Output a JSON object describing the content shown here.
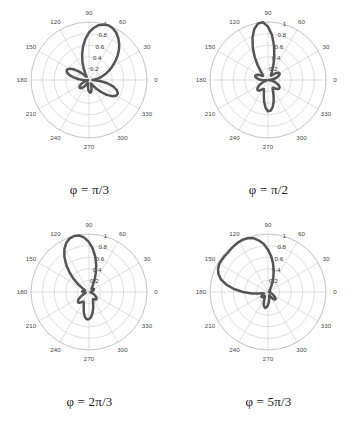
{
  "figure": {
    "background_color": "#ffffff",
    "curve_color": "#555555",
    "grid_color": "#b9b9b9",
    "panel_count": 4
  },
  "chart_data": [
    {
      "type": "line",
      "subtype": "polar",
      "title": "",
      "caption": "φ = π/3",
      "caption_parts": {
        "variable": "φ",
        "equals": "=",
        "value": "π/3"
      },
      "panel_index": 0,
      "xlabel": "",
      "ylabel": "",
      "rlim": [
        0,
        1
      ],
      "rticks": [
        0.2,
        0.4,
        0.6,
        0.8,
        1
      ],
      "rtick_labels": [
        "0.2",
        "0.4",
        "0.6",
        "0.8",
        "1"
      ],
      "theta_ticks_deg": [
        0,
        30,
        60,
        90,
        120,
        150,
        180,
        210,
        240,
        270,
        300,
        330
      ],
      "theta_tick_labels": [
        "0",
        "30",
        "60",
        "90",
        "120",
        "150",
        "180",
        "210",
        "240",
        "270",
        "300",
        "330"
      ],
      "theta_direction": "counterclockwise",
      "theta_zero_location": "E",
      "grid": true,
      "legend": "none",
      "theta_deg": [
        0,
        5,
        10,
        15,
        20,
        25,
        30,
        35,
        40,
        45,
        50,
        55,
        60,
        65,
        70,
        75,
        80,
        85,
        90,
        95,
        100,
        105,
        110,
        115,
        120,
        125,
        130,
        135,
        140,
        145,
        150,
        155,
        160,
        165,
        170,
        175,
        180,
        185,
        190,
        195,
        200,
        205,
        210,
        215,
        220,
        225,
        230,
        235,
        240,
        245,
        250,
        255,
        260,
        265,
        270,
        275,
        280,
        285,
        290,
        295,
        300,
        305,
        310,
        315,
        320,
        325,
        330,
        335,
        340,
        345,
        350,
        355,
        360
      ],
      "r": [
        0.06,
        0.1,
        0.16,
        0.23,
        0.3,
        0.38,
        0.46,
        0.55,
        0.64,
        0.73,
        0.81,
        0.88,
        0.94,
        0.98,
        1.0,
        0.99,
        0.96,
        0.9,
        0.82,
        0.71,
        0.59,
        0.46,
        0.33,
        0.21,
        0.12,
        0.07,
        0.08,
        0.14,
        0.23,
        0.32,
        0.39,
        0.42,
        0.41,
        0.36,
        0.28,
        0.19,
        0.1,
        0.04,
        0.02,
        0.04,
        0.08,
        0.13,
        0.17,
        0.2,
        0.21,
        0.2,
        0.17,
        0.13,
        0.09,
        0.06,
        0.05,
        0.07,
        0.11,
        0.16,
        0.2,
        0.22,
        0.21,
        0.17,
        0.12,
        0.08,
        0.07,
        0.11,
        0.19,
        0.29,
        0.4,
        0.49,
        0.54,
        0.55,
        0.51,
        0.43,
        0.32,
        0.19,
        0.06
      ]
    },
    {
      "type": "line",
      "subtype": "polar",
      "title": "",
      "caption": "φ = π/2",
      "caption_parts": {
        "variable": "φ",
        "equals": "=",
        "value": "π/2"
      },
      "panel_index": 1,
      "xlabel": "",
      "ylabel": "",
      "rlim": [
        0,
        1
      ],
      "rticks": [
        0.2,
        0.4,
        0.6,
        0.8,
        1
      ],
      "rtick_labels": [
        "0.2",
        "0.4",
        "0.6",
        "0.8",
        "1"
      ],
      "theta_ticks_deg": [
        0,
        30,
        60,
        90,
        120,
        150,
        180,
        210,
        240,
        270,
        300,
        330
      ],
      "theta_tick_labels": [
        "0",
        "30",
        "60",
        "90",
        "120",
        "150",
        "180",
        "210",
        "240",
        "270",
        "300",
        "330"
      ],
      "theta_direction": "counterclockwise",
      "theta_zero_location": "E",
      "grid": true,
      "legend": "none",
      "theta_deg": [
        0,
        5,
        10,
        15,
        20,
        25,
        30,
        35,
        40,
        45,
        50,
        55,
        60,
        65,
        70,
        75,
        80,
        85,
        90,
        95,
        100,
        105,
        110,
        115,
        120,
        125,
        130,
        135,
        140,
        145,
        150,
        155,
        160,
        165,
        170,
        175,
        180,
        185,
        190,
        195,
        200,
        205,
        210,
        215,
        220,
        225,
        230,
        235,
        240,
        245,
        250,
        255,
        260,
        265,
        270,
        275,
        280,
        285,
        290,
        295,
        300,
        305,
        310,
        315,
        320,
        325,
        330,
        335,
        340,
        345,
        350,
        355,
        360
      ],
      "r": [
        0.01,
        0.05,
        0.1,
        0.15,
        0.19,
        0.22,
        0.23,
        0.22,
        0.19,
        0.15,
        0.11,
        0.09,
        0.1,
        0.16,
        0.27,
        0.42,
        0.6,
        0.78,
        0.92,
        1.0,
        0.99,
        0.91,
        0.78,
        0.62,
        0.46,
        0.31,
        0.2,
        0.13,
        0.11,
        0.13,
        0.17,
        0.21,
        0.23,
        0.23,
        0.2,
        0.16,
        0.11,
        0.06,
        0.02,
        0.02,
        0.06,
        0.11,
        0.17,
        0.21,
        0.24,
        0.25,
        0.24,
        0.21,
        0.18,
        0.17,
        0.2,
        0.28,
        0.38,
        0.48,
        0.54,
        0.53,
        0.47,
        0.38,
        0.28,
        0.2,
        0.16,
        0.16,
        0.19,
        0.22,
        0.24,
        0.24,
        0.23,
        0.2,
        0.16,
        0.12,
        0.08,
        0.04,
        0.01
      ]
    },
    {
      "type": "line",
      "subtype": "polar",
      "title": "",
      "caption": "φ = 2π/3",
      "caption_parts": {
        "variable": "φ",
        "equals": "=",
        "value": "2π/3"
      },
      "panel_index": 2,
      "xlabel": "",
      "ylabel": "",
      "rlim": [
        0,
        1
      ],
      "rticks": [
        0.2,
        0.4,
        0.6,
        0.8,
        1
      ],
      "rtick_labels": [
        "0.2",
        "0.4",
        "0.6",
        "0.8",
        "1"
      ],
      "theta_ticks_deg": [
        0,
        30,
        60,
        90,
        120,
        150,
        180,
        210,
        240,
        270,
        300,
        330
      ],
      "theta_tick_labels": [
        "0",
        "30",
        "60",
        "90",
        "120",
        "150",
        "180",
        "210",
        "240",
        "270",
        "300",
        "330"
      ],
      "theta_direction": "counterclockwise",
      "theta_zero_location": "E",
      "grid": true,
      "legend": "none",
      "theta_deg": [
        0,
        5,
        10,
        15,
        20,
        25,
        30,
        35,
        40,
        45,
        50,
        55,
        60,
        65,
        70,
        75,
        80,
        85,
        90,
        95,
        100,
        105,
        110,
        115,
        120,
        125,
        130,
        135,
        140,
        145,
        150,
        155,
        160,
        165,
        170,
        175,
        180,
        185,
        190,
        195,
        200,
        205,
        210,
        215,
        220,
        225,
        230,
        235,
        240,
        245,
        250,
        255,
        260,
        265,
        270,
        275,
        280,
        285,
        290,
        295,
        300,
        305,
        310,
        315,
        320,
        325,
        330,
        335,
        340,
        345,
        350,
        355,
        360
      ],
      "r": [
        0.03,
        0.03,
        0.04,
        0.06,
        0.08,
        0.09,
        0.1,
        0.1,
        0.09,
        0.08,
        0.07,
        0.08,
        0.13,
        0.22,
        0.34,
        0.48,
        0.62,
        0.75,
        0.86,
        0.94,
        0.99,
        1.0,
        0.98,
        0.93,
        0.85,
        0.74,
        0.61,
        0.47,
        0.34,
        0.22,
        0.13,
        0.08,
        0.07,
        0.09,
        0.11,
        0.12,
        0.11,
        0.09,
        0.07,
        0.06,
        0.08,
        0.12,
        0.17,
        0.22,
        0.25,
        0.26,
        0.24,
        0.21,
        0.19,
        0.21,
        0.27,
        0.35,
        0.43,
        0.47,
        0.47,
        0.43,
        0.36,
        0.28,
        0.21,
        0.16,
        0.14,
        0.15,
        0.17,
        0.18,
        0.17,
        0.15,
        0.12,
        0.09,
        0.06,
        0.04,
        0.03,
        0.03,
        0.03
      ]
    },
    {
      "type": "line",
      "subtype": "polar",
      "title": "",
      "caption": "φ = 5π/3",
      "caption_parts": {
        "variable": "φ",
        "equals": "=",
        "value": "5π/3"
      },
      "panel_index": 3,
      "xlabel": "",
      "ylabel": "",
      "rlim": [
        0,
        1
      ],
      "rticks": [
        0.2,
        0.4,
        0.6,
        0.8,
        1
      ],
      "rtick_labels": [
        "0.2",
        "0.4",
        "0.6",
        "0.8",
        "1"
      ],
      "theta_ticks_deg": [
        0,
        30,
        60,
        90,
        120,
        150,
        180,
        210,
        240,
        270,
        300,
        330
      ],
      "theta_tick_labels": [
        "0",
        "30",
        "60",
        "90",
        "120",
        "150",
        "180",
        "210",
        "240",
        "270",
        "300",
        "330"
      ],
      "theta_direction": "counterclockwise",
      "theta_zero_location": "E",
      "grid": true,
      "legend": "none",
      "theta_deg": [
        0,
        5,
        10,
        15,
        20,
        25,
        30,
        35,
        40,
        45,
        50,
        55,
        60,
        65,
        70,
        75,
        80,
        85,
        90,
        95,
        100,
        105,
        110,
        115,
        120,
        125,
        130,
        135,
        140,
        145,
        150,
        155,
        160,
        165,
        170,
        175,
        180,
        185,
        190,
        195,
        200,
        205,
        210,
        215,
        220,
        225,
        230,
        235,
        240,
        245,
        250,
        255,
        260,
        265,
        270,
        275,
        280,
        285,
        290,
        295,
        300,
        305,
        310,
        315,
        320,
        325,
        330,
        335,
        340,
        345,
        350,
        355,
        360
      ],
      "r": [
        0.02,
        0.02,
        0.02,
        0.03,
        0.03,
        0.04,
        0.04,
        0.04,
        0.04,
        0.04,
        0.05,
        0.07,
        0.11,
        0.18,
        0.27,
        0.38,
        0.5,
        0.62,
        0.73,
        0.83,
        0.9,
        0.96,
        0.99,
        1.0,
        1.0,
        0.99,
        0.98,
        0.97,
        0.97,
        0.97,
        0.97,
        0.95,
        0.91,
        0.84,
        0.73,
        0.59,
        0.43,
        0.28,
        0.16,
        0.09,
        0.07,
        0.09,
        0.12,
        0.14,
        0.14,
        0.12,
        0.1,
        0.09,
        0.11,
        0.16,
        0.22,
        0.26,
        0.28,
        0.26,
        0.22,
        0.17,
        0.12,
        0.08,
        0.06,
        0.07,
        0.1,
        0.14,
        0.17,
        0.18,
        0.17,
        0.14,
        0.11,
        0.08,
        0.05,
        0.04,
        0.03,
        0.02,
        0.02
      ]
    }
  ],
  "panels": [
    {
      "caption": "φ = π/3",
      "name": "polar-plot-phi-pi-over-3"
    },
    {
      "caption": "φ = π/2",
      "name": "polar-plot-phi-pi-over-2"
    },
    {
      "caption": "φ = 2π/3",
      "name": "polar-plot-phi-2pi-over-3"
    },
    {
      "caption": "φ = 5π/3",
      "name": "polar-plot-phi-5pi-over-3"
    }
  ]
}
